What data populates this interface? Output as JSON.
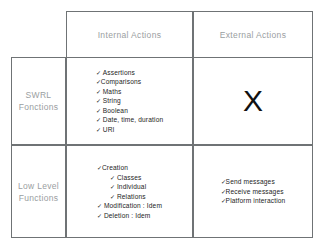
{
  "diagram": {
    "column_headers": [
      {
        "id": "internal",
        "label": "Internal Actions"
      },
      {
        "id": "external",
        "label": "External Actions"
      }
    ],
    "row_headers": [
      {
        "id": "swrl",
        "line1": "SWRL",
        "line2": "Fonctions"
      },
      {
        "id": "lowlevel",
        "line1": "Low Level",
        "line2": "Functions"
      }
    ],
    "cells": {
      "swrl_internal": {
        "type": "list",
        "items": [
          {
            "text": "Assertions",
            "indent": 0
          },
          {
            "text": "Comparisons",
            "indent": 0,
            "tight": true
          },
          {
            "text": "Maths",
            "indent": 0
          },
          {
            "text": "String",
            "indent": 0
          },
          {
            "text": "Boolean",
            "indent": 0
          },
          {
            "text": "Date, time, duration",
            "indent": 0
          },
          {
            "text": "URI",
            "indent": 0
          }
        ]
      },
      "swrl_external": {
        "type": "mark",
        "mark": "X"
      },
      "lowlevel_internal": {
        "type": "list",
        "items": [
          {
            "text": "Creation",
            "indent": 0,
            "tight": true
          },
          {
            "text": "Classes",
            "indent": 1
          },
          {
            "text": "Individual",
            "indent": 1
          },
          {
            "text": "Relations",
            "indent": 1
          },
          {
            "text": "Modification : Idem",
            "indent": 0
          },
          {
            "text": "Deletion  : Idem",
            "indent": 0
          }
        ]
      },
      "lowlevel_external": {
        "type": "list",
        "items": [
          {
            "text": "Send messages",
            "indent": 0,
            "tight": true
          },
          {
            "text": "Receive messages",
            "indent": 0,
            "tight": true
          },
          {
            "text": "Platform interaction",
            "indent": 0,
            "tight": true
          }
        ]
      }
    },
    "icons": {
      "check": "✓"
    },
    "colors": {
      "border": "#6f7375",
      "header_text": "#9a9ea1",
      "body_text": "#1d1d1d",
      "background": "#ffffff"
    }
  }
}
